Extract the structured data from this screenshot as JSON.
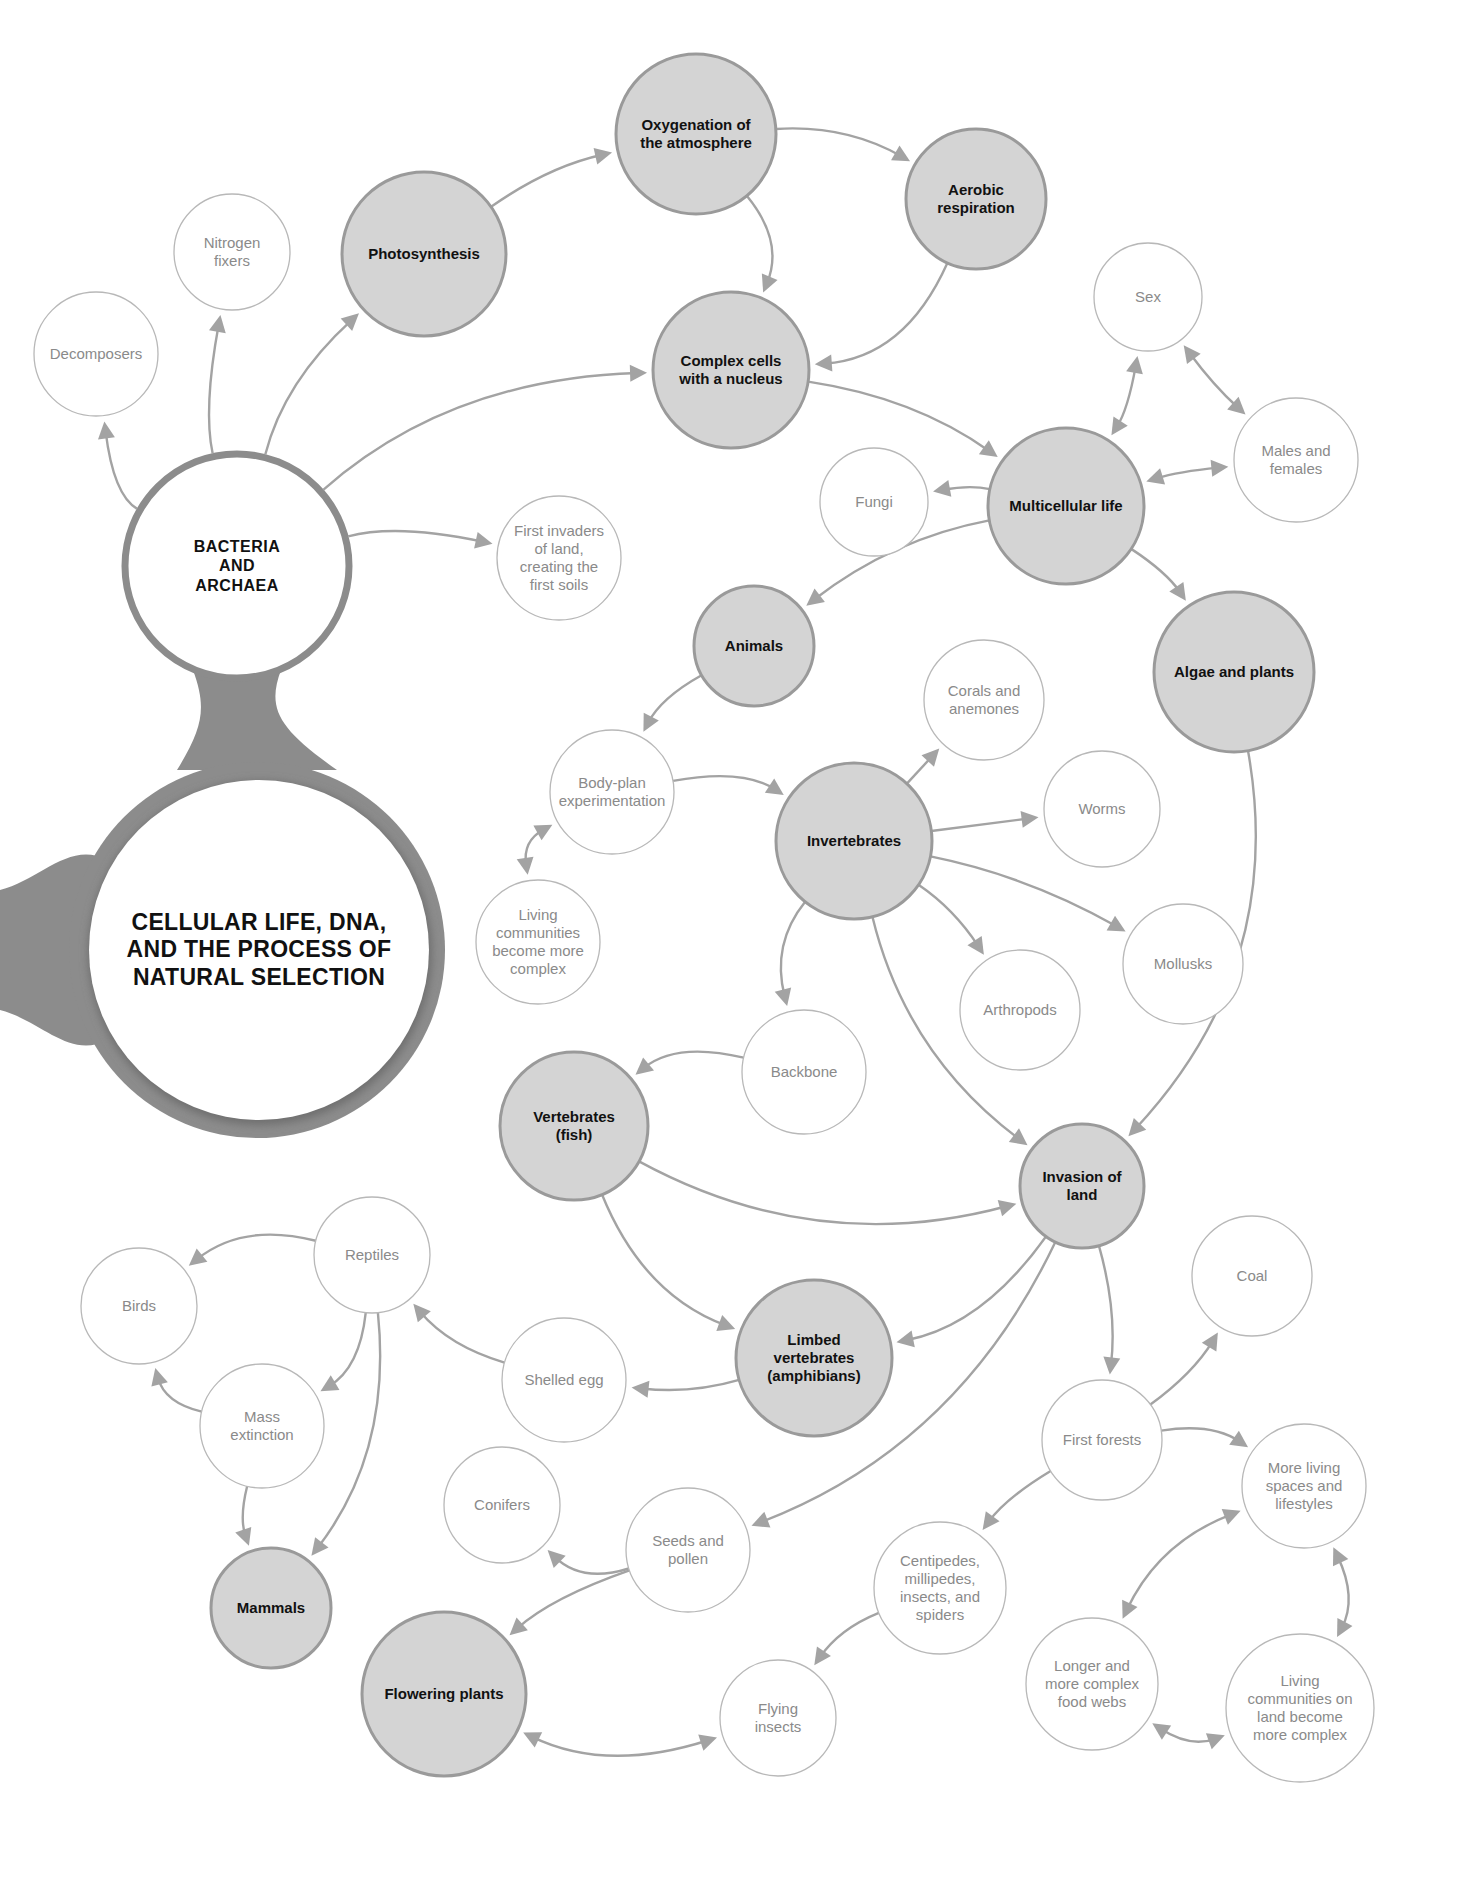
{
  "diagram": {
    "title": "CELLULAR LIFE, DNA, AND THE PROCESS OF NATURAL SELECTION",
    "colors": {
      "major_fill": "#d4d4d4",
      "major_stroke": "#9a9a9a",
      "minor_stroke": "#b8b8b8",
      "arrow": "#a3a3a3",
      "hub_ring": "#8c8c8c",
      "text_major": "#111111",
      "text_minor": "#8a8a8a"
    },
    "root": {
      "id": "root",
      "label": "CELLULAR LIFE, DNA, AND THE PROCESS OF NATURAL SELECTION",
      "x": 257,
      "y": 950,
      "r": 172
    },
    "hub": {
      "id": "bacteria",
      "label": "BACTERIA AND ARCHAEA",
      "x": 237,
      "y": 566,
      "r": 112
    },
    "nodes": [
      {
        "id": "decomposers",
        "label": "Decomposers",
        "type": "minor",
        "x": 96,
        "y": 354,
        "r": 62
      },
      {
        "id": "nitrogen",
        "label": "Nitrogen fixers",
        "type": "minor",
        "x": 232,
        "y": 252,
        "r": 58
      },
      {
        "id": "photosynthesis",
        "label": "Photosynthesis",
        "type": "major",
        "x": 424,
        "y": 254,
        "r": 82
      },
      {
        "id": "oxygenation",
        "label": "Oxygenation of the atmosphere",
        "type": "major",
        "x": 696,
        "y": 134,
        "r": 80
      },
      {
        "id": "aerobic",
        "label": "Aerobic respiration",
        "type": "major",
        "x": 976,
        "y": 199,
        "r": 70
      },
      {
        "id": "complex",
        "label": "Complex cells with a nucleus",
        "type": "major",
        "x": 731,
        "y": 370,
        "r": 78
      },
      {
        "id": "sex",
        "label": "Sex",
        "type": "minor",
        "x": 1148,
        "y": 297,
        "r": 54
      },
      {
        "id": "males",
        "label": "Males and females",
        "type": "minor",
        "x": 1296,
        "y": 460,
        "r": 62
      },
      {
        "id": "fungi",
        "label": "Fungi",
        "type": "minor",
        "x": 874,
        "y": 502,
        "r": 54
      },
      {
        "id": "multicellular",
        "label": "Multicellular life",
        "type": "major",
        "x": 1066,
        "y": 506,
        "r": 78
      },
      {
        "id": "invaders",
        "label": "First invaders of land, creating the first soils",
        "type": "minor",
        "x": 559,
        "y": 558,
        "r": 62
      },
      {
        "id": "animals",
        "label": "Animals",
        "type": "major",
        "x": 754,
        "y": 646,
        "r": 60
      },
      {
        "id": "algae",
        "label": "Algae and plants",
        "type": "major",
        "x": 1234,
        "y": 672,
        "r": 80
      },
      {
        "id": "corals",
        "label": "Corals and anemones",
        "type": "minor",
        "x": 984,
        "y": 700,
        "r": 60
      },
      {
        "id": "bodyplan",
        "label": "Body-plan experimentation",
        "type": "minor",
        "x": 612,
        "y": 792,
        "r": 62
      },
      {
        "id": "worms",
        "label": "Worms",
        "type": "minor",
        "x": 1102,
        "y": 809,
        "r": 58
      },
      {
        "id": "invertebrates",
        "label": "Invertebrates",
        "type": "major",
        "x": 854,
        "y": 841,
        "r": 78
      },
      {
        "id": "livingcomm",
        "label": "Living communities become more complex",
        "type": "minor",
        "x": 538,
        "y": 942,
        "r": 62
      },
      {
        "id": "mollusks",
        "label": "Mollusks",
        "type": "minor",
        "x": 1183,
        "y": 964,
        "r": 60
      },
      {
        "id": "arthropods",
        "label": "Arthropods",
        "type": "minor",
        "x": 1020,
        "y": 1010,
        "r": 60
      },
      {
        "id": "backbone",
        "label": "Backbone",
        "type": "minor",
        "x": 804,
        "y": 1072,
        "r": 62
      },
      {
        "id": "vertebrates",
        "label": "Vertebrates (fish)",
        "type": "major",
        "x": 574,
        "y": 1126,
        "r": 74
      },
      {
        "id": "invasion",
        "label": "Invasion of land",
        "type": "major",
        "x": 1082,
        "y": 1186,
        "r": 62
      },
      {
        "id": "reptiles",
        "label": "Reptiles",
        "type": "minor",
        "x": 372,
        "y": 1255,
        "r": 58
      },
      {
        "id": "birds",
        "label": "Birds",
        "type": "minor",
        "x": 139,
        "y": 1306,
        "r": 58
      },
      {
        "id": "coal",
        "label": "Coal",
        "type": "minor",
        "x": 1252,
        "y": 1276,
        "r": 60
      },
      {
        "id": "limbed",
        "label": "Limbed vertebrates (amphibians)",
        "type": "major",
        "x": 814,
        "y": 1358,
        "r": 78
      },
      {
        "id": "shelled",
        "label": "Shelled egg",
        "type": "minor",
        "x": 564,
        "y": 1380,
        "r": 62
      },
      {
        "id": "mass",
        "label": "Mass extinction",
        "type": "minor",
        "x": 262,
        "y": 1426,
        "r": 62
      },
      {
        "id": "forests",
        "label": "First forests",
        "type": "minor",
        "x": 1102,
        "y": 1440,
        "r": 60
      },
      {
        "id": "moreliving",
        "label": "More living spaces and lifestyles",
        "type": "minor",
        "x": 1304,
        "y": 1486,
        "r": 62
      },
      {
        "id": "conifers",
        "label": "Conifers",
        "type": "minor",
        "x": 502,
        "y": 1505,
        "r": 58
      },
      {
        "id": "seeds",
        "label": "Seeds and pollen",
        "type": "minor",
        "x": 688,
        "y": 1550,
        "r": 62
      },
      {
        "id": "centipedes",
        "label": "Centipedes, millipedes, insects, and spiders",
        "type": "minor",
        "x": 940,
        "y": 1588,
        "r": 66
      },
      {
        "id": "mammals",
        "label": "Mammals",
        "type": "major",
        "x": 271,
        "y": 1608,
        "r": 60
      },
      {
        "id": "flowering",
        "label": "Flowering plants",
        "type": "major",
        "x": 444,
        "y": 1694,
        "r": 82
      },
      {
        "id": "foodwebs",
        "label": "Longer and more complex food webs",
        "type": "minor",
        "x": 1092,
        "y": 1684,
        "r": 66
      },
      {
        "id": "livingland",
        "label": "Living communities on land become more complex",
        "type": "minor",
        "x": 1300,
        "y": 1708,
        "r": 74
      },
      {
        "id": "flying",
        "label": "Flying insects",
        "type": "minor",
        "x": 778,
        "y": 1718,
        "r": 58
      }
    ],
    "edges": [
      {
        "from": "bacteria",
        "to": "decomposers",
        "bend": -0.25,
        "dir": "one"
      },
      {
        "from": "bacteria",
        "to": "nitrogen",
        "bend": -0.1,
        "dir": "one"
      },
      {
        "from": "bacteria",
        "to": "photosynthesis",
        "bend": -0.15,
        "dir": "one"
      },
      {
        "from": "bacteria",
        "to": "complex",
        "bend": -0.18,
        "dir": "one"
      },
      {
        "from": "bacteria",
        "to": "invaders",
        "bend": -0.12,
        "dir": "one"
      },
      {
        "from": "photosynthesis",
        "to": "oxygenation",
        "bend": -0.1,
        "dir": "one"
      },
      {
        "from": "oxygenation",
        "to": "aerobic",
        "bend": -0.15,
        "dir": "one"
      },
      {
        "from": "oxygenation",
        "to": "complex",
        "bend": -0.3,
        "dir": "one"
      },
      {
        "from": "aerobic",
        "to": "complex",
        "bend": -0.3,
        "dir": "one"
      },
      {
        "from": "complex",
        "to": "multicellular",
        "bend": -0.12,
        "dir": "one"
      },
      {
        "from": "multicellular",
        "to": "sex",
        "bend": 0.1,
        "dir": "both"
      },
      {
        "from": "sex",
        "to": "males",
        "bend": 0.05,
        "dir": "both"
      },
      {
        "from": "multicellular",
        "to": "males",
        "bend": -0.05,
        "dir": "both"
      },
      {
        "from": "multicellular",
        "to": "fungi",
        "bend": 0.1,
        "dir": "one"
      },
      {
        "from": "multicellular",
        "to": "algae",
        "bend": -0.1,
        "dir": "one"
      },
      {
        "from": "multicellular",
        "to": "animals",
        "bend": 0.12,
        "dir": "one"
      },
      {
        "from": "animals",
        "to": "bodyplan",
        "bend": 0.15,
        "dir": "one"
      },
      {
        "from": "bodyplan",
        "to": "invertebrates",
        "bend": -0.2,
        "dir": "one"
      },
      {
        "from": "bodyplan",
        "to": "livingcomm",
        "bend": 0.35,
        "dir": "both"
      },
      {
        "from": "invertebrates",
        "to": "corals",
        "bend": 0.0,
        "dir": "one"
      },
      {
        "from": "invertebrates",
        "to": "worms",
        "bend": 0.0,
        "dir": "one"
      },
      {
        "from": "invertebrates",
        "to": "mollusks",
        "bend": -0.08,
        "dir": "one"
      },
      {
        "from": "invertebrates",
        "to": "arthropods",
        "bend": -0.1,
        "dir": "one"
      },
      {
        "from": "invertebrates",
        "to": "backbone",
        "bend": 0.25,
        "dir": "one"
      },
      {
        "from": "invertebrates",
        "to": "invasion",
        "bend": 0.18,
        "dir": "one"
      },
      {
        "from": "backbone",
        "to": "vertebrates",
        "bend": 0.25,
        "dir": "one"
      },
      {
        "from": "algae",
        "to": "invasion",
        "bend": -0.25,
        "dir": "one"
      },
      {
        "from": "vertebrates",
        "to": "invasion",
        "bend": 0.2,
        "dir": "one"
      },
      {
        "from": "vertebrates",
        "to": "limbed",
        "bend": 0.22,
        "dir": "one"
      },
      {
        "from": "invasion",
        "to": "limbed",
        "bend": -0.2,
        "dir": "one"
      },
      {
        "from": "invasion",
        "to": "forests",
        "bend": -0.1,
        "dir": "one"
      },
      {
        "from": "invasion",
        "to": "seeds",
        "bend": -0.2,
        "dir": "one"
      },
      {
        "from": "limbed",
        "to": "shelled",
        "bend": -0.1,
        "dir": "one"
      },
      {
        "from": "shelled",
        "to": "reptiles",
        "bend": -0.15,
        "dir": "one"
      },
      {
        "from": "reptiles",
        "to": "birds",
        "bend": 0.25,
        "dir": "one"
      },
      {
        "from": "reptiles",
        "to": "mass",
        "bend": -0.25,
        "dir": "one"
      },
      {
        "from": "reptiles",
        "to": "mammals",
        "bend": -0.2,
        "dir": "one"
      },
      {
        "from": "mass",
        "to": "birds",
        "bend": -0.3,
        "dir": "one"
      },
      {
        "from": "mass",
        "to": "mammals",
        "bend": 0.15,
        "dir": "one"
      },
      {
        "from": "seeds",
        "to": "conifers",
        "bend": -0.3,
        "dir": "one"
      },
      {
        "from": "seeds",
        "to": "flowering",
        "bend": 0.1,
        "dir": "one"
      },
      {
        "from": "forests",
        "to": "coal",
        "bend": 0.1,
        "dir": "one"
      },
      {
        "from": "forests",
        "to": "moreliving",
        "bend": -0.2,
        "dir": "one"
      },
      {
        "from": "forests",
        "to": "centipedes",
        "bend": 0.1,
        "dir": "one"
      },
      {
        "from": "centipedes",
        "to": "flying",
        "bend": 0.15,
        "dir": "one"
      },
      {
        "from": "flowering",
        "to": "flying",
        "bend": 0.2,
        "dir": "both"
      },
      {
        "from": "moreliving",
        "to": "foodwebs",
        "bend": 0.2,
        "dir": "both"
      },
      {
        "from": "moreliving",
        "to": "livingland",
        "bend": -0.25,
        "dir": "both"
      },
      {
        "from": "foodwebs",
        "to": "livingland",
        "bend": 0.25,
        "dir": "both"
      }
    ]
  }
}
